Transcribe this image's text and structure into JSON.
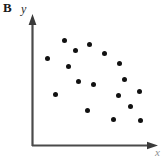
{
  "figure": {
    "panel_label": "B",
    "y_axis_label": "y",
    "x_axis_label": "x",
    "axis_color": "#4a4a4a",
    "point_color": "#111111",
    "background_color": "#ffffff"
  },
  "chart_data": {
    "type": "scatter",
    "title": "B",
    "xlabel": "x",
    "ylabel": "y",
    "grid": false,
    "legend": null,
    "axis_style": "arrow-headed L-shaped axes, no tick marks, no tick labels",
    "xlim": [
      0,
      100
    ],
    "ylim": [
      0,
      100
    ],
    "n_points": 17,
    "x": [
      26,
      46,
      35,
      11,
      57,
      29,
      69,
      36,
      49,
      73,
      19,
      68,
      85,
      43,
      78,
      64,
      86
    ],
    "y": [
      85,
      82,
      77,
      70,
      74,
      63,
      66,
      51,
      49,
      53,
      43,
      42,
      45,
      29,
      33,
      21,
      20
    ],
    "points_px": [
      {
        "x": 64.7,
        "y": 40.0
      },
      {
        "x": 89.0,
        "y": 44.0
      },
      {
        "x": 75.7,
        "y": 50.7
      },
      {
        "x": 47.0,
        "y": 58.7
      },
      {
        "x": 104.3,
        "y": 53.3
      },
      {
        "x": 68.0,
        "y": 66.7
      },
      {
        "x": 119.0,
        "y": 63.3
      },
      {
        "x": 78.0,
        "y": 81.7
      },
      {
        "x": 93.7,
        "y": 84.3
      },
      {
        "x": 124.7,
        "y": 79.3
      },
      {
        "x": 55.7,
        "y": 94.0
      },
      {
        "x": 118.3,
        "y": 95.3
      },
      {
        "x": 139.7,
        "y": 91.7
      },
      {
        "x": 87.0,
        "y": 110.0
      },
      {
        "x": 130.3,
        "y": 106.7
      },
      {
        "x": 113.0,
        "y": 119.3
      },
      {
        "x": 140.3,
        "y": 120.7
      }
    ]
  }
}
